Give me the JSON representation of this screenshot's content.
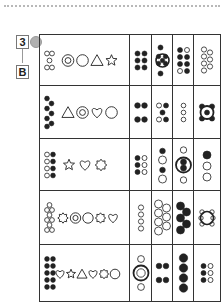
{
  "header": {
    "exercise_number": "3",
    "level_letter": "B",
    "apple_icon": "apple-icon"
  },
  "rows": [
    {
      "index": 1,
      "cluster": {
        "count": 5,
        "filled": false,
        "pattern": "dice-5"
      },
      "shapes": [
        "double-circle",
        "circle",
        "triangle",
        "star"
      ],
      "answers": [
        {
          "kind": "dots",
          "filled": 6,
          "empty": 0,
          "pattern": "3x2"
        },
        {
          "kind": "ring-with-dots",
          "filled": 7,
          "empty": 0
        },
        {
          "kind": "dots",
          "filled": 6,
          "empty": 2,
          "pattern": "4x2"
        },
        {
          "kind": "dots",
          "filled": 0,
          "empty": 7,
          "pattern": "zigzag"
        }
      ]
    },
    {
      "index": 2,
      "cluster": {
        "count": 7,
        "filled": true,
        "pattern": "zigzag"
      },
      "shapes": [
        "triangle",
        "double-circle",
        "heart",
        "circle"
      ],
      "answers": [
        {
          "kind": "dots",
          "filled": 4,
          "empty": 0,
          "pattern": "2x2-gap"
        },
        {
          "kind": "dots",
          "filled": 3,
          "empty": 2,
          "pattern": "x"
        },
        {
          "kind": "dots",
          "filled": 0,
          "empty": 3,
          "pattern": "column"
        },
        {
          "kind": "ring-with-dots",
          "filled": 5,
          "empty": 0
        }
      ]
    },
    {
      "index": 3,
      "cluster": {
        "count": 8,
        "filled": 4,
        "empty": 4,
        "pattern": "4x2"
      },
      "shapes": [
        "star",
        "heart",
        "sun"
      ],
      "answers": [
        {
          "kind": "dots",
          "filled": 3,
          "empty": 3,
          "pattern": "3x2"
        },
        {
          "kind": "dots",
          "filled": 2,
          "empty": 2,
          "pattern": "column"
        },
        {
          "kind": "ring-with-dots",
          "filled": 2,
          "empty": 2
        },
        {
          "kind": "dots",
          "filled": 1,
          "empty": 2,
          "pattern": "column"
        }
      ]
    },
    {
      "index": 4,
      "cluster": {
        "count": 9,
        "filled": false,
        "pattern": "zigzag"
      },
      "shapes": [
        "sun",
        "double-circle",
        "circle",
        "sun",
        "heart"
      ],
      "answers": [
        {
          "kind": "dots",
          "filled": 0,
          "empty": 4,
          "pattern": "column"
        },
        {
          "kind": "dots",
          "filled": 0,
          "empty": 7,
          "pattern": "zigzag"
        },
        {
          "kind": "dots",
          "filled": 5,
          "empty": 0,
          "pattern": "zigzag"
        },
        {
          "kind": "ring-with-dots",
          "filled": 0,
          "empty": 6
        }
      ]
    },
    {
      "index": 5,
      "cluster": {
        "count": 10,
        "filled": true,
        "pattern": "5x2"
      },
      "shapes": [
        "heart",
        "star",
        "triangle",
        "heart",
        "sun",
        "circle"
      ],
      "answers": [
        {
          "kind": "ring-with-dots",
          "filled": 0,
          "empty": 3
        },
        {
          "kind": "dots",
          "filled": 4,
          "empty": 0,
          "pattern": "2x2-gap"
        },
        {
          "kind": "dots",
          "filled": 4,
          "empty": 0,
          "pattern": "column"
        },
        {
          "kind": "dots",
          "filled": 3,
          "empty": 3,
          "pattern": "3x2"
        }
      ]
    }
  ],
  "colors": {
    "ink": "#222222",
    "border": "#333333",
    "badge_border": "#777777",
    "apple": "#b0b0b0",
    "rule": "#b8b8b8"
  }
}
